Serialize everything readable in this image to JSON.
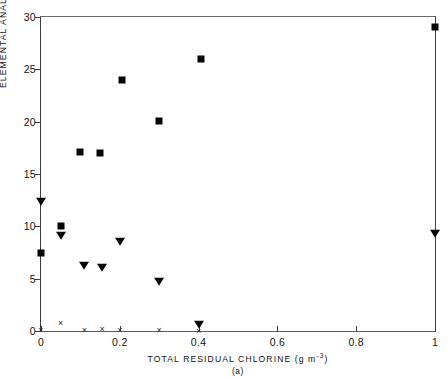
{
  "figure": {
    "panel_label": "(a)",
    "background": "#ffffff",
    "marker_color": "#050505",
    "axis_color": "#3c3c3c"
  },
  "chart_data": {
    "type": "scatter",
    "title": "",
    "xlabel": "TOTAL RESIDUAL CHLORINE (g m",
    "xlabel_exponent": "-3",
    "xlabel_suffix": ")",
    "ylabel": "ELEMENTAL ANALYSES",
    "xlim": [
      0,
      1
    ],
    "ylim": [
      0,
      30
    ],
    "xticks": [
      0,
      0.2,
      0.4,
      0.6,
      0.8,
      1
    ],
    "xticklabels": [
      "0",
      "0.2",
      "0.4",
      "0.6",
      "0.8",
      "1"
    ],
    "yticks": [
      0,
      5,
      10,
      15,
      20,
      25,
      30
    ],
    "yticklabels": [
      "0",
      "5",
      "10",
      "15",
      "20",
      "25",
      "30"
    ],
    "grid": false,
    "legend": "none",
    "series": [
      {
        "name": "filled-square",
        "marker": "square",
        "points": [
          {
            "x": 0.0,
            "y": 7.5
          },
          {
            "x": 0.05,
            "y": 10.0
          },
          {
            "x": 0.1,
            "y": 17.1
          },
          {
            "x": 0.15,
            "y": 17.0
          },
          {
            "x": 0.205,
            "y": 24.0
          },
          {
            "x": 0.3,
            "y": 20.1
          },
          {
            "x": 0.405,
            "y": 26.0
          },
          {
            "x": 1.0,
            "y": 29.0
          }
        ]
      },
      {
        "name": "filled-triangle-down",
        "marker": "triangle-down",
        "points": [
          {
            "x": 0.0,
            "y": 12.4
          },
          {
            "x": 0.05,
            "y": 9.2
          },
          {
            "x": 0.11,
            "y": 6.3
          },
          {
            "x": 0.155,
            "y": 6.1
          },
          {
            "x": 0.2,
            "y": 8.6
          },
          {
            "x": 0.3,
            "y": 4.8
          },
          {
            "x": 0.4,
            "y": 0.7
          },
          {
            "x": 1.0,
            "y": 9.4
          }
        ]
      },
      {
        "name": "cross",
        "marker": "x",
        "points": [
          {
            "x": 0.0,
            "y": 0.1
          },
          {
            "x": 0.05,
            "y": 0.8
          },
          {
            "x": 0.11,
            "y": 0.05
          },
          {
            "x": 0.155,
            "y": 0.2
          },
          {
            "x": 0.2,
            "y": 0.05
          },
          {
            "x": 0.3,
            "y": 0.05
          },
          {
            "x": 0.4,
            "y": 0.0
          }
        ]
      }
    ]
  }
}
